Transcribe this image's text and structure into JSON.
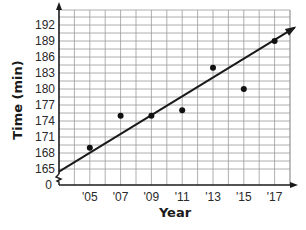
{
  "chart_data": {
    "type": "scatter",
    "title": "",
    "xlabel": "Year",
    "ylabel": "Time (min)",
    "x_tick_labels": [
      "'05",
      "'07",
      "'09",
      "'11",
      "'13",
      "'15",
      "'17"
    ],
    "x_ticks": [
      2005,
      2007,
      2009,
      2011,
      2013,
      2015,
      2017
    ],
    "y_tick_labels": [
      "0",
      "165",
      "168",
      "171",
      "174",
      "177",
      "180",
      "183",
      "186",
      "189",
      "192"
    ],
    "y_ticks": [
      165,
      168,
      171,
      174,
      177,
      180,
      183,
      186,
      189,
      192
    ],
    "y_axis_break": true,
    "xlim": [
      2003,
      2018
    ],
    "ylim": [
      162,
      195
    ],
    "grid": true,
    "legend": null,
    "series": [
      {
        "name": "Data points",
        "type": "scatter",
        "x": [
          2005,
          2007,
          2009,
          2011,
          2013,
          2015,
          2017
        ],
        "y": [
          169,
          175,
          175,
          176,
          184,
          180,
          189
        ]
      },
      {
        "name": "Trend line",
        "type": "line",
        "x": [
          2003,
          2018.3
        ],
        "y": [
          164.5,
          191.5
        ],
        "arrow_end": true
      }
    ]
  }
}
